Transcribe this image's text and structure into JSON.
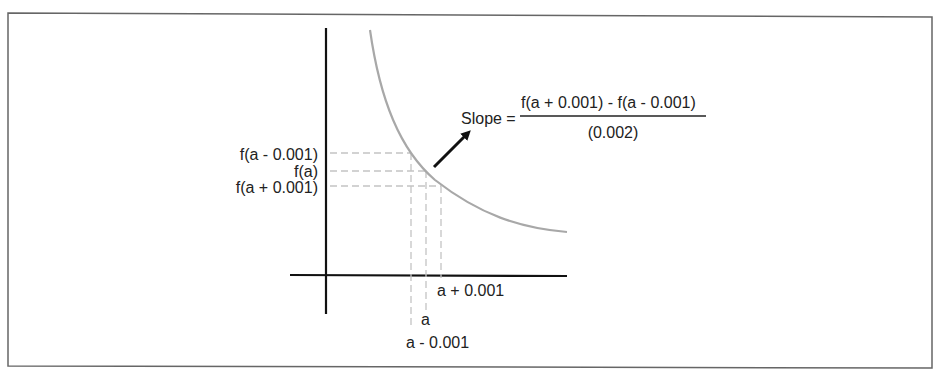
{
  "diagram": {
    "y_labels": {
      "f_minus": "f(a - 0.001)",
      "f_a": "f(a)",
      "f_plus": "f(a + 0.001)"
    },
    "x_labels": {
      "a_plus": "a + 0.001",
      "a": "a",
      "a_minus": "a - 0.001"
    },
    "formula": {
      "lhs": "Slope =",
      "numerator": "f(a + 0.001) - f(a - 0.001)",
      "denominator": "(0.002)"
    },
    "colors": {
      "axis": "#111111",
      "curve": "#a8a8a8",
      "guides": "#c8c8c8",
      "frame": "#555555",
      "arrow": "#111111"
    }
  }
}
